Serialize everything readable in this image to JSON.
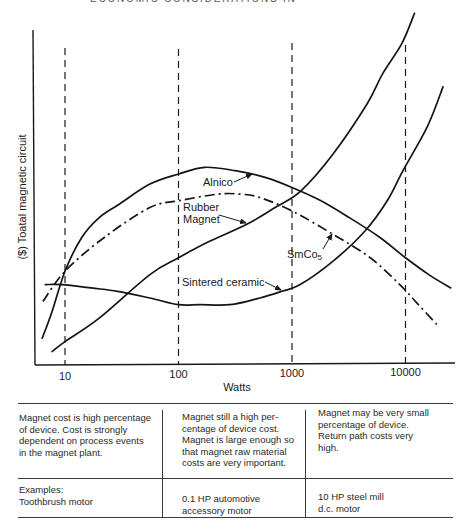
{
  "page": {
    "header_partial": "ECONOMIC CONSIDERATIONS IN"
  },
  "chart_data": {
    "type": "line",
    "title": "",
    "xlabel": "Watts",
    "ylabel": "($) Toatal magnetic circuit",
    "x_scale": "log",
    "x_ticks": [
      10,
      100,
      1000,
      10000
    ],
    "x_tick_labels": [
      "10",
      "100",
      "1000",
      "10000"
    ],
    "xlim": [
      6,
      26000
    ],
    "ylim": [
      0,
      11
    ],
    "grid": "dashed vertical lines at 10, 100, 1000, 10000 W",
    "legend": "none (direct curve labels with arrows)",
    "series": [
      {
        "name": "Alnico",
        "style": "solid",
        "x": [
          6.3,
          7.7,
          10,
          14,
          20,
          30,
          56,
          100,
          170,
          315,
          580,
          1000,
          1800,
          3200,
          6000,
          10000,
          16000,
          25000
        ],
        "y": [
          0.8,
          1.6,
          2.8,
          3.8,
          4.4,
          4.8,
          5.4,
          5.7,
          5.9,
          5.8,
          5.6,
          5.3,
          4.9,
          4.4,
          3.8,
          3.2,
          2.7,
          2.3
        ]
      },
      {
        "name": "Rubber Magnet",
        "style": "solid",
        "x": [
          7.7,
          10,
          20,
          56,
          100,
          190,
          400,
          710,
          1200,
          2300,
          4600,
          6300,
          9300,
          12000
        ],
        "y": [
          0.4,
          0.7,
          1.4,
          2.7,
          3.2,
          3.7,
          4.2,
          4.7,
          5.2,
          6.3,
          7.8,
          8.7,
          9.6,
          10.5
        ]
      },
      {
        "name": "SmCo5",
        "style": "dash-dot",
        "x": [
          6.4,
          10,
          22,
          56,
          100,
          220,
          350,
          520,
          1000,
          2300,
          4900,
          8900,
          13000,
          19000
        ],
        "y": [
          1.9,
          2.8,
          3.8,
          4.7,
          4.9,
          5.1,
          5.1,
          5.0,
          4.6,
          3.9,
          3.2,
          2.4,
          1.8,
          1.2
        ]
      },
      {
        "name": "Sintered ceramic",
        "style": "solid",
        "x": [
          6.7,
          9.4,
          17,
          29,
          56,
          100,
          155,
          285,
          520,
          815,
          1180,
          2300,
          4400,
          6900,
          9500,
          15500,
          21400
        ],
        "y": [
          2.4,
          2.4,
          2.3,
          2.2,
          2.0,
          1.8,
          1.8,
          1.8,
          2.0,
          2.2,
          2.4,
          3.1,
          4.0,
          4.9,
          5.8,
          7.1,
          8.3
        ]
      }
    ],
    "annotations": [
      {
        "text": "Alnico",
        "target": "Alnico"
      },
      {
        "text": "Rubber\nMagnet",
        "target": "Rubber Magnet"
      },
      {
        "text": "SmCo",
        "subscript": "5",
        "target": "SmCo5"
      },
      {
        "text": "Sintered ceramic",
        "target": "Sintered ceramic"
      }
    ]
  },
  "table": {
    "rows": [
      {
        "cells": [
          "Magnet cost is high percentage\nof device. Cost is strongly\ndependent on process events\nin the magnet plant.",
          "Magnet still a high per-\ncentage of device cost.\nMagnet is large enough so\nthat magnet raw material\ncosts are very important.",
          "Magnet may be very small\npercentage of device.\nReturn path costs very\nhigh."
        ]
      },
      {
        "cells": [
          "Examples:\nToothbrush motor",
          "0.1 HP automotive\naccessory motor",
          "10 HP steel mill\nd.c. motor"
        ]
      }
    ]
  }
}
